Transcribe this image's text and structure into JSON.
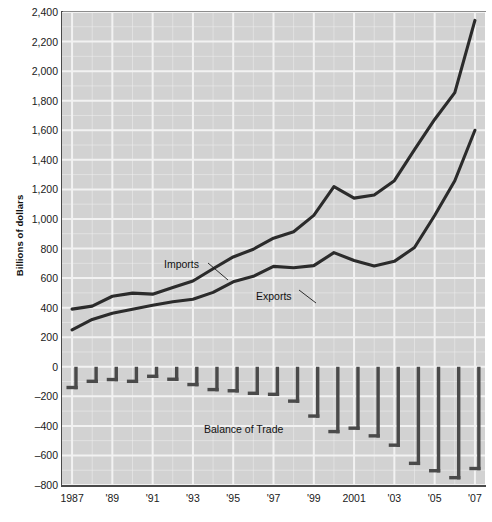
{
  "chart_data": {
    "type": "line",
    "title": "",
    "xlabel": "",
    "ylabel": "Billions of dollars",
    "ylim": [
      -800,
      2400
    ],
    "xlim": [
      1986.5,
      2007.5
    ],
    "grid": true,
    "legend": "inline-annotations",
    "x": [
      1987,
      1988,
      1989,
      1990,
      1991,
      1992,
      1993,
      1994,
      1995,
      1996,
      1997,
      1998,
      1999,
      2000,
      2001,
      2002,
      2003,
      2004,
      2005,
      2006,
      2007
    ],
    "y_ticks": [
      "2,400",
      "2,200",
      "2,000",
      "1,800",
      "1,600",
      "1,400",
      "1,200",
      "1,000",
      "800",
      "600",
      "400",
      "200",
      "0",
      "-200",
      "-400",
      "-600",
      "-800"
    ],
    "y_tick_values": [
      2400,
      2200,
      2000,
      1800,
      1600,
      1400,
      1200,
      1000,
      800,
      600,
      400,
      200,
      0,
      -200,
      -400,
      -600,
      -800
    ],
    "x_ticks": [
      "1987",
      "'89",
      "'91",
      "'93",
      "'95",
      "'97",
      "'99",
      "2001",
      "'03",
      "'05",
      "'07"
    ],
    "x_tick_values": [
      1987,
      1989,
      1991,
      1993,
      1995,
      1997,
      1999,
      2001,
      2003,
      2005,
      2007
    ],
    "series": [
      {
        "name": "Imports",
        "label": "Imports",
        "color": "#2b2b2b",
        "values": [
          390,
          410,
          477,
          498,
          491,
          536,
          580,
          663,
          743,
          795,
          870,
          913,
          1024,
          1218,
          1141,
          1162,
          1259,
          1469,
          1673,
          1855,
          2343
        ]
      },
      {
        "name": "Exports",
        "label": "Exports",
        "color": "#2b2b2b",
        "values": [
          250,
          320,
          362,
          389,
          416,
          440,
          457,
          503,
          575,
          612,
          679,
          670,
          684,
          772,
          719,
          682,
          713,
          807,
          1023,
          1258,
          1600
        ]
      },
      {
        "name": "Balance of Trade",
        "label": "Balance of Trade",
        "type": "bar",
        "color": "#4a4a4a",
        "values": [
          -152,
          -110,
          -98,
          -110,
          -76,
          -96,
          -132,
          -166,
          -174,
          -191,
          -198,
          -244,
          -345,
          -450,
          -427,
          -479,
          -542,
          -665,
          -715,
          -762,
          -700
        ]
      }
    ],
    "annotations": [
      {
        "text": "Imports",
        "points_to": "imports-line"
      },
      {
        "text": "Exports",
        "points_to": "exports-line"
      },
      {
        "text": "Balance of Trade",
        "points_to": "balance-bars"
      }
    ]
  },
  "colors": {
    "plot_background": "#d2d2d2",
    "grid": "#f2f2f2",
    "line": "#2b2b2b",
    "bar": "#4a4a4a",
    "axis": "#4a4a4a",
    "text": "#1a1a1a"
  }
}
